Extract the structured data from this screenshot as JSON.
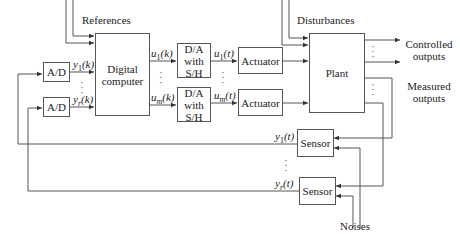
{
  "diagram": {
    "type": "block-diagram",
    "blocks": {
      "ad_1": "A/D",
      "ad_2": "A/D",
      "computer": "Digital computer",
      "computer_line1": "Digital",
      "computer_line2": "computer",
      "da_1": [
        "D/A",
        "with",
        "S/H"
      ],
      "da_2": [
        "D/A",
        "with",
        "S/H"
      ],
      "actuator_1": "Actuator",
      "actuator_2": "Actuator",
      "plant": "Plant",
      "sensor_1": "Sensor",
      "sensor_2": "Sensor"
    },
    "labels": {
      "references": "References",
      "disturbances": "Disturbances",
      "controlled_outputs_1": "Controlled",
      "controlled_outputs_2": "outputs",
      "measured_outputs_1": "Measured",
      "measured_outputs_2": "outputs",
      "noises": "Noises",
      "y1k": "y1(k)",
      "yrk": "yr(k)",
      "u1k": "u1(k)",
      "umk": "um(k)",
      "u1t": "u1(t)",
      "umt": "um(t)",
      "y1t": "y1(t)",
      "yrt": "yr(t)"
    },
    "signal_parts": {
      "y": "y",
      "u": "u",
      "k": "(k)",
      "t": "(t)",
      "sub1": "1",
      "subr": "r",
      "subm": "m"
    }
  }
}
